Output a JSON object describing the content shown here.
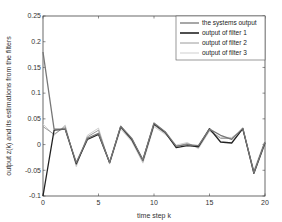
{
  "chart_data": {
    "type": "line",
    "title": "",
    "xlabel": "time step k",
    "ylabel": "output z(k) and its estimations from the filters",
    "xlim": [
      0,
      20
    ],
    "ylim": [
      -0.1,
      0.25
    ],
    "xticks": [
      0,
      5,
      10,
      15,
      20
    ],
    "yticks": [
      -0.1,
      -0.05,
      0,
      0.05,
      0.1,
      0.15,
      0.2,
      0.25
    ],
    "ytick_labels": [
      "-0.1",
      "-0.05",
      "0",
      "0.05",
      "0.1",
      "0.15",
      "0.2",
      "0.25"
    ],
    "xtick_labels": [
      "0",
      "5",
      "10",
      "15",
      "20"
    ],
    "grid": false,
    "legend_position": "upper right",
    "x": [
      0,
      1,
      2,
      3,
      4,
      5,
      6,
      7,
      8,
      9,
      10,
      11,
      12,
      13,
      14,
      15,
      16,
      17,
      18,
      19,
      20
    ],
    "series": [
      {
        "name": "the systems output",
        "color": "#777777",
        "width": 1.3,
        "values": [
          0.18,
          0.03,
          0.03,
          -0.035,
          0.012,
          0.022,
          -0.035,
          0.036,
          0.012,
          -0.03,
          0.042,
          0.025,
          -0.003,
          0.0,
          -0.002,
          0.03,
          0.018,
          0.01,
          0.032,
          -0.055,
          0.005
        ]
      },
      {
        "name": "output of filter 1",
        "color": "#222222",
        "width": 1.3,
        "values": [
          -0.1,
          0.028,
          0.03,
          -0.037,
          0.01,
          0.02,
          -0.035,
          0.035,
          0.01,
          -0.03,
          0.04,
          0.024,
          -0.006,
          -0.002,
          -0.004,
          0.031,
          0.005,
          0.003,
          0.031,
          -0.056,
          0.003
        ]
      },
      {
        "name": "output of filter 2",
        "color": "#9a9a9a",
        "width": 1.0,
        "values": [
          0.035,
          0.02,
          0.035,
          -0.04,
          0.015,
          0.028,
          -0.036,
          0.033,
          0.008,
          -0.033,
          0.038,
          0.022,
          -0.004,
          0.002,
          -0.006,
          0.028,
          0.012,
          0.012,
          0.03,
          -0.053,
          0.006
        ]
      },
      {
        "name": "output of filter 3",
        "color": "#cfcfcf",
        "width": 1.0,
        "values": [
          0.04,
          0.018,
          0.038,
          -0.043,
          0.018,
          0.032,
          -0.038,
          0.03,
          0.006,
          -0.036,
          0.035,
          0.02,
          -0.001,
          0.004,
          -0.008,
          0.026,
          0.014,
          0.014,
          0.029,
          -0.05,
          0.008
        ]
      }
    ]
  },
  "legend": {
    "items": [
      {
        "label": "the systems output",
        "color": "#777777",
        "width": 1.3
      },
      {
        "label": "output of filter 1",
        "color": "#222222",
        "width": 1.6
      },
      {
        "label": "output of filter 2",
        "color": "#9a9a9a",
        "width": 1.0
      },
      {
        "label": "output of filter 3",
        "color": "#cfcfcf",
        "width": 1.0
      }
    ]
  },
  "axes": {
    "xlabel": "time step k",
    "ylabel": "output z(k) and its estimations from the filters"
  }
}
